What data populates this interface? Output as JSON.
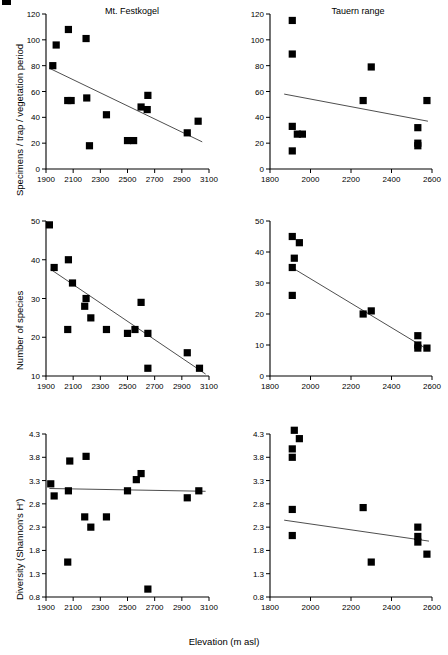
{
  "figure": {
    "global_xlabel": "Elevation (m asl)",
    "column_titles": [
      "Mt. Festkogel",
      "Tauern range"
    ]
  },
  "chart_data": [
    {
      "type": "scatter",
      "panel": "top-left",
      "title": "Mt. Festkogel",
      "xlabel": "Elevation (m asl)",
      "ylabel": "Specimens / trap / vegetation period",
      "xlim": [
        1900,
        3100
      ],
      "ylim": [
        0,
        120
      ],
      "xticks": [
        1900,
        2100,
        2300,
        2500,
        2700,
        2900,
        3100
      ],
      "yticks": [
        0,
        20,
        40,
        60,
        80,
        100,
        120
      ],
      "grid": false,
      "points": [
        {
          "x": 1950,
          "y": 80
        },
        {
          "x": 1975,
          "y": 96
        },
        {
          "x": 2065,
          "y": 108
        },
        {
          "x": 2195,
          "y": 101
        },
        {
          "x": 2060,
          "y": 53
        },
        {
          "x": 2085,
          "y": 53
        },
        {
          "x": 2200,
          "y": 55
        },
        {
          "x": 2345,
          "y": 42
        },
        {
          "x": 2650,
          "y": 57
        },
        {
          "x": 2600,
          "y": 48
        },
        {
          "x": 2645,
          "y": 46
        },
        {
          "x": 2940,
          "y": 28
        },
        {
          "x": 3020,
          "y": 37
        },
        {
          "x": 2220,
          "y": 18
        },
        {
          "x": 2500,
          "y": 22
        },
        {
          "x": 2545,
          "y": 22
        }
      ],
      "fit_line": {
        "x1": 1925,
        "y1": 78,
        "x2": 3050,
        "y2": 21
      }
    },
    {
      "type": "scatter",
      "panel": "top-right",
      "title": "Tauern range",
      "xlabel": "Elevation (m asl)",
      "ylabel": "Specimens / trap / vegetation period",
      "xlim": [
        1800,
        2600
      ],
      "ylim": [
        0,
        120
      ],
      "xticks": [
        1800,
        2000,
        2200,
        2400,
        2600
      ],
      "yticks": [
        0,
        20,
        40,
        60,
        80,
        100,
        120
      ],
      "grid": false,
      "points": [
        {
          "x": 1910,
          "y": 115
        },
        {
          "x": 1910,
          "y": 89
        },
        {
          "x": 2300,
          "y": 79
        },
        {
          "x": 2260,
          "y": 53
        },
        {
          "x": 2575,
          "y": 53
        },
        {
          "x": 1910,
          "y": 33
        },
        {
          "x": 1935,
          "y": 27
        },
        {
          "x": 1960,
          "y": 27
        },
        {
          "x": 2530,
          "y": 32
        },
        {
          "x": 2530,
          "y": 20
        },
        {
          "x": 2530,
          "y": 18
        },
        {
          "x": 1910,
          "y": 14
        }
      ],
      "fit_line": {
        "x1": 1870,
        "y1": 58,
        "x2": 2580,
        "y2": 37
      }
    },
    {
      "type": "scatter",
      "panel": "middle-left",
      "title": "Mt. Festkogel",
      "xlabel": "Elevation (m asl)",
      "ylabel": "Number of species",
      "xlim": [
        1900,
        3100
      ],
      "ylim": [
        10,
        50
      ],
      "xticks": [
        1900,
        2100,
        2300,
        2500,
        2700,
        2900,
        3100
      ],
      "yticks": [
        10,
        20,
        30,
        40,
        50
      ],
      "grid": false,
      "points": [
        {
          "x": 1925,
          "y": 49
        },
        {
          "x": 1960,
          "y": 38
        },
        {
          "x": 2065,
          "y": 40
        },
        {
          "x": 2095,
          "y": 34
        },
        {
          "x": 2195,
          "y": 30
        },
        {
          "x": 2185,
          "y": 28
        },
        {
          "x": 2230,
          "y": 25
        },
        {
          "x": 2060,
          "y": 22
        },
        {
          "x": 2345,
          "y": 22
        },
        {
          "x": 2500,
          "y": 21
        },
        {
          "x": 2555,
          "y": 22
        },
        {
          "x": 2600,
          "y": 29
        },
        {
          "x": 2650,
          "y": 21
        },
        {
          "x": 2650,
          "y": 12
        },
        {
          "x": 2940,
          "y": 16
        },
        {
          "x": 3030,
          "y": 12
        }
      ],
      "fit_line": {
        "x1": 1935,
        "y1": 37.5,
        "x2": 3075,
        "y2": 10.5
      }
    },
    {
      "type": "scatter",
      "panel": "middle-right",
      "title": "Tauern range",
      "xlabel": "Elevation (m asl)",
      "ylabel": "Number of species",
      "xlim": [
        1800,
        2600
      ],
      "ylim": [
        0,
        50
      ],
      "xticks": [
        1800,
        2000,
        2200,
        2400,
        2600
      ],
      "yticks": [
        0,
        10,
        20,
        30,
        40,
        50
      ],
      "grid": false,
      "points": [
        {
          "x": 1910,
          "y": 45
        },
        {
          "x": 1945,
          "y": 43
        },
        {
          "x": 1920,
          "y": 38
        },
        {
          "x": 1910,
          "y": 35
        },
        {
          "x": 1910,
          "y": 26
        },
        {
          "x": 2260,
          "y": 20
        },
        {
          "x": 2300,
          "y": 21
        },
        {
          "x": 2530,
          "y": 13
        },
        {
          "x": 2530,
          "y": 10
        },
        {
          "x": 2530,
          "y": 9
        },
        {
          "x": 2575,
          "y": 9
        }
      ],
      "fit_line": {
        "x1": 1908,
        "y1": 35,
        "x2": 2580,
        "y2": 8.5
      }
    },
    {
      "type": "scatter",
      "panel": "bottom-left",
      "title": "Mt. Festkogel",
      "xlabel": "Elevation (m asl)",
      "ylabel": "Diversity (Shannon's H')",
      "xlim": [
        1900,
        3100
      ],
      "ylim": [
        0.8,
        4.3
      ],
      "xticks": [
        1900,
        2100,
        2300,
        2500,
        2700,
        2900,
        3100
      ],
      "yticks": [
        0.8,
        1.3,
        1.8,
        2.3,
        2.8,
        3.3,
        3.8,
        4.3
      ],
      "grid": false,
      "points": [
        {
          "x": 1935,
          "y": 3.23
        },
        {
          "x": 1960,
          "y": 2.97
        },
        {
          "x": 2065,
          "y": 3.08
        },
        {
          "x": 2075,
          "y": 3.72
        },
        {
          "x": 2195,
          "y": 3.82
        },
        {
          "x": 2185,
          "y": 2.52
        },
        {
          "x": 2230,
          "y": 2.3
        },
        {
          "x": 2345,
          "y": 2.52
        },
        {
          "x": 2500,
          "y": 3.08
        },
        {
          "x": 2565,
          "y": 3.32
        },
        {
          "x": 2600,
          "y": 3.45
        },
        {
          "x": 2940,
          "y": 2.93
        },
        {
          "x": 3025,
          "y": 3.08
        },
        {
          "x": 2060,
          "y": 1.55
        },
        {
          "x": 2650,
          "y": 0.97
        }
      ],
      "fit_line": {
        "x1": 1925,
        "y1": 3.13,
        "x2": 3075,
        "y2": 3.07
      }
    },
    {
      "type": "scatter",
      "panel": "bottom-right",
      "title": "Tauern range",
      "xlabel": "Elevation (m asl)",
      "ylabel": "Diversity (Shannon's H')",
      "xlim": [
        1800,
        2600
      ],
      "ylim": [
        0.8,
        4.3
      ],
      "xticks": [
        1800,
        2000,
        2200,
        2400,
        2600
      ],
      "yticks": [
        0.8,
        1.3,
        1.8,
        2.3,
        2.8,
        3.3,
        3.8,
        4.3
      ],
      "grid": false,
      "points": [
        {
          "x": 1920,
          "y": 4.38
        },
        {
          "x": 1945,
          "y": 4.2
        },
        {
          "x": 1910,
          "y": 3.98
        },
        {
          "x": 1910,
          "y": 3.8
        },
        {
          "x": 1910,
          "y": 2.68
        },
        {
          "x": 2260,
          "y": 2.72
        },
        {
          "x": 1910,
          "y": 2.12
        },
        {
          "x": 2530,
          "y": 2.3
        },
        {
          "x": 2530,
          "y": 2.1
        },
        {
          "x": 2530,
          "y": 1.98
        },
        {
          "x": 2575,
          "y": 1.72
        },
        {
          "x": 2300,
          "y": 1.55
        }
      ],
      "fit_line": {
        "x1": 1870,
        "y1": 2.45,
        "x2": 2585,
        "y2": 2.0
      }
    }
  ],
  "panels": {
    "tl": {
      "title": "Mt. Festkogel",
      "ylabel": "Specimens / trap / vegetation period"
    },
    "tr": {
      "title": "Tauern range"
    },
    "ml": {
      "ylabel": "Number of species"
    },
    "bl": {
      "ylabel": "Diversity (Shannon's H')"
    }
  }
}
